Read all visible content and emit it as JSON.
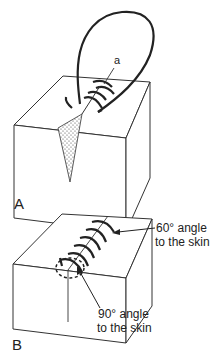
{
  "figure": {
    "panels": [
      {
        "id": "A",
        "label": "A",
        "callouts": [
          {
            "text": "a"
          }
        ]
      },
      {
        "id": "B",
        "label": "B",
        "callouts": [
          {
            "line1": "60° angle",
            "line2": "to the skin"
          },
          {
            "line1": "90° angle",
            "line2": "to the skin"
          }
        ]
      }
    ]
  }
}
